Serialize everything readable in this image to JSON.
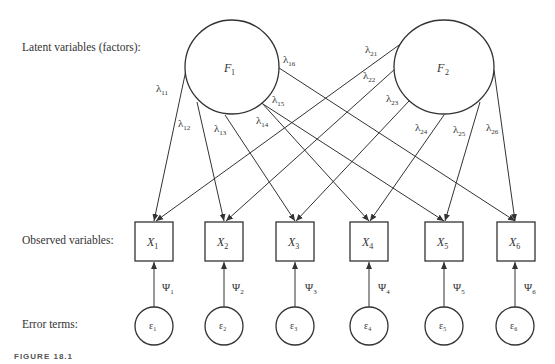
{
  "row_labels": {
    "latent": "Latent variables (factors):",
    "observed": "Observed variables:",
    "errors": "Error terms:"
  },
  "caption": "FIGURE 18.1",
  "factors": [
    {
      "id": "F1",
      "label": "F",
      "sub": "1"
    },
    {
      "id": "F2",
      "label": "F",
      "sub": "2"
    }
  ],
  "observed": [
    {
      "label": "X",
      "sub": "1"
    },
    {
      "label": "X",
      "sub": "2"
    },
    {
      "label": "X",
      "sub": "3"
    },
    {
      "label": "X",
      "sub": "4"
    },
    {
      "label": "X",
      "sub": "5"
    },
    {
      "label": "X",
      "sub": "6"
    }
  ],
  "errors": [
    {
      "label": "ε",
      "sub": "1",
      "psi": "Ψ",
      "psi_sub": "1"
    },
    {
      "label": "ε",
      "sub": "2",
      "psi": "Ψ",
      "psi_sub": "2"
    },
    {
      "label": "ε",
      "sub": "3",
      "psi": "Ψ",
      "psi_sub": "3"
    },
    {
      "label": "ε",
      "sub": "4",
      "psi": "Ψ",
      "psi_sub": "4"
    },
    {
      "label": "ε",
      "sub": "5",
      "psi": "Ψ",
      "psi_sub": "5"
    },
    {
      "label": "ε",
      "sub": "6",
      "psi": "Ψ",
      "psi_sub": "6"
    }
  ],
  "loadings": {
    "l11": "11",
    "l12": "12",
    "l13": "13",
    "l14": "14",
    "l15": "15",
    "l16": "16",
    "l21": "21",
    "l22": "22",
    "l23": "23",
    "l24": "24",
    "l25": "25",
    "l26": "26",
    "symbol": "λ"
  }
}
